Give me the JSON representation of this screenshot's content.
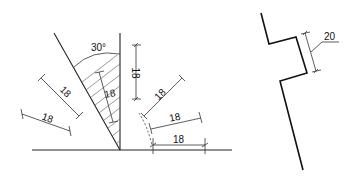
{
  "figures": {
    "left": {
      "angle_label": "30°",
      "dimensions": {
        "vertical_right": "18",
        "inner_hatch": "18",
        "left_upper": "18",
        "left_lower": "18",
        "right_upper": "18",
        "right_middle": "18",
        "right_lower": "18"
      }
    },
    "right": {
      "dimensions": {
        "offset": "20"
      }
    }
  },
  "colors": {
    "stroke": "#222222",
    "background": "#ffffff"
  }
}
